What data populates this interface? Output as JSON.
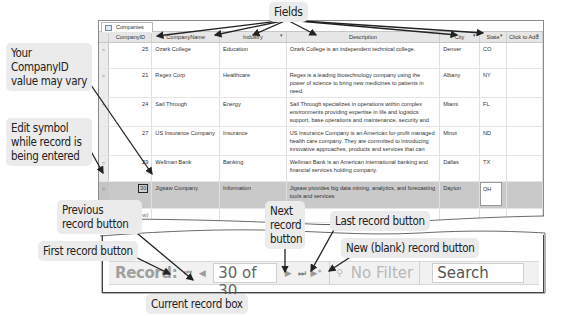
{
  "window": {
    "tab_label": "Companies",
    "columns": [
      {
        "label": "CompanyID",
        "dropdown": "▾"
      },
      {
        "label": "CompanyName",
        "dropdown": "▾"
      },
      {
        "label": "Industry",
        "dropdown": "▾"
      },
      {
        "label": "Description",
        "dropdown": "▾"
      },
      {
        "label": "City",
        "dropdown": "▾"
      },
      {
        "label": "State",
        "dropdown": "▾"
      },
      {
        "label": "Click to Add",
        "dropdown": "▾"
      }
    ],
    "rows": [
      {
        "selector": "⌗",
        "id": "25",
        "name": "Ozark College",
        "industry": "Education",
        "description": "Ozark College is an independent technical college.",
        "city": "Denver",
        "state": "CO"
      },
      {
        "selector": "⌗",
        "id": "21",
        "name": "Regex Corp",
        "industry": "Healthcare",
        "description": "Regex is a leading biotechnology company using the power of science to bring new medicines to patients in need.",
        "city": "Albany",
        "state": "NY"
      },
      {
        "selector": "⌗",
        "id": "24",
        "name": "Sail Through",
        "industry": "Energy",
        "description": "Sail Through specializes in operations within complex environments providing expertise in life and logistics support, base operations and maintenance, security and",
        "city": "Miami",
        "state": "FL"
      },
      {
        "selector": "",
        "id": "27",
        "name": "US Insurance Company",
        "industry": "Insurance",
        "description": "US Insurance Company is an American for-profit managed health care company. They are committed to introducing innovative approaches, products and services that can",
        "city": "Minot",
        "state": "ND"
      },
      {
        "selector": "⌗",
        "id": "29",
        "name": "Wellman Bank",
        "industry": "Banking",
        "description": "Wellman Bank is an American international banking and financial services holding company.",
        "city": "Dallas",
        "state": "TX"
      }
    ],
    "editing_row": {
      "edit_icon": "✎",
      "selector": "⌗",
      "id": "30",
      "name": "Jigsaw Company",
      "industry": "Information",
      "description": "Jigsaw provides big data mining, analytics, and forecasting tools and services",
      "city": "Dayton",
      "state": "OH"
    },
    "new_row_label": "(New)"
  },
  "navigation": {
    "record_label": "Record:",
    "first_icon": "⏮",
    "prev_icon": "◀",
    "current_record": "30 of 30",
    "next_icon": "▶",
    "last_icon": "⏭",
    "new_icon": "▶*",
    "filter_icon": "⚲",
    "filter_label": "No Filter",
    "search_placeholder": "Search"
  },
  "callouts": {
    "fields": "Fields",
    "company_id": "Your CompanyID value may vary",
    "edit_symbol": "Edit symbol while record is being entered",
    "previous_record": "Previous record button",
    "next_record": "Next record button",
    "last_record": "Last record button",
    "new_record": "New (blank) record button",
    "first_record": "First record button",
    "current_record": "Current record box"
  }
}
